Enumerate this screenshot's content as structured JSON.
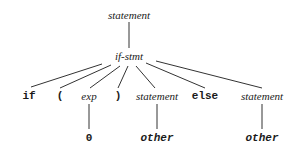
{
  "diagram": {
    "type": "parse-tree",
    "nodes": {
      "root": {
        "label": "statement",
        "x": 129,
        "y": 15
      },
      "ifstmt": {
        "label": "if-stmt",
        "x": 129,
        "y": 56
      },
      "if_tok": {
        "label": "if",
        "x": 29,
        "y": 96
      },
      "lparen": {
        "label": "(",
        "x": 60,
        "y": 96
      },
      "exp": {
        "label": "exp",
        "x": 89,
        "y": 96
      },
      "rparen": {
        "label": ")",
        "x": 118,
        "y": 96
      },
      "stmt1": {
        "label": "statement",
        "x": 157,
        "y": 96
      },
      "else_tok": {
        "label": "else",
        "x": 205,
        "y": 96
      },
      "stmt2": {
        "label": "statement",
        "x": 262,
        "y": 96
      },
      "zero": {
        "label": "0",
        "x": 89,
        "y": 138
      },
      "other1": {
        "label": "other",
        "x": 157,
        "y": 138
      },
      "other2": {
        "label": "other",
        "x": 262,
        "y": 138
      }
    },
    "edges": [
      {
        "from": "root",
        "to": "ifstmt",
        "x1": 129,
        "y1": 22,
        "x2": 129,
        "y2": 48
      },
      {
        "from": "ifstmt",
        "to": "if_tok",
        "x1": 102,
        "y1": 64,
        "x2": 31,
        "y2": 87
      },
      {
        "from": "ifstmt",
        "to": "lparen",
        "x1": 111,
        "y1": 65,
        "x2": 60,
        "y2": 88
      },
      {
        "from": "ifstmt",
        "to": "exp",
        "x1": 120,
        "y1": 66,
        "x2": 90,
        "y2": 88
      },
      {
        "from": "ifstmt",
        "to": "rparen",
        "x1": 128,
        "y1": 66,
        "x2": 118,
        "y2": 88
      },
      {
        "from": "ifstmt",
        "to": "stmt1",
        "x1": 136,
        "y1": 66,
        "x2": 155,
        "y2": 88
      },
      {
        "from": "ifstmt",
        "to": "else_tok",
        "x1": 146,
        "y1": 63,
        "x2": 205,
        "y2": 88
      },
      {
        "from": "ifstmt",
        "to": "stmt2",
        "x1": 156,
        "y1": 61,
        "x2": 262,
        "y2": 88
      },
      {
        "from": "exp",
        "to": "zero",
        "x1": 89,
        "y1": 104,
        "x2": 89,
        "y2": 129
      },
      {
        "from": "stmt1",
        "to": "other1",
        "x1": 157,
        "y1": 104,
        "x2": 157,
        "y2": 129
      },
      {
        "from": "stmt2",
        "to": "other2",
        "x1": 262,
        "y1": 104,
        "x2": 262,
        "y2": 129
      }
    ],
    "line_color": "#333333"
  }
}
